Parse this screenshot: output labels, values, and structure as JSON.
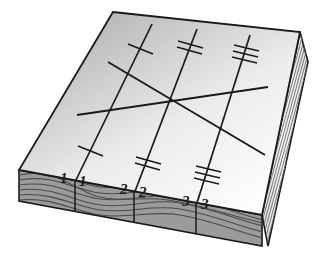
{
  "figure": {
    "type": "isometric-block-diagram",
    "background_color": "#ffffff",
    "outline_color": "#1a1a1a"
  },
  "colors": {
    "top_face_light": "#ffffff",
    "top_face_dark": "#a9a9a9",
    "front_edge_fill": "#9b9b9b",
    "grain_line": "#4a4a4a",
    "side_face_fill": "#f2f2f2",
    "side_hatch": "#6e6e6e",
    "stroke": "#1a1a1a"
  },
  "geometry": {
    "top_face": [
      [
        113,
        12
      ],
      [
        300,
        32
      ],
      [
        262,
        215
      ],
      [
        19,
        170
      ]
    ],
    "front_edge": [
      [
        19,
        170
      ],
      [
        262,
        215
      ],
      [
        262,
        246
      ],
      [
        19,
        201
      ]
    ],
    "right_side": [
      [
        262,
        215
      ],
      [
        300,
        32
      ],
      [
        308,
        62
      ],
      [
        268,
        246
      ]
    ],
    "top_edge_back": [
      [
        113,
        12
      ],
      [
        300,
        32
      ]
    ],
    "front_top_edge": [
      [
        19,
        170
      ],
      [
        262,
        215
      ]
    ]
  },
  "cut_lines": [
    {
      "id": "line-1",
      "label_left": "1",
      "label_right": "1",
      "tick_count": 1,
      "top_point": [
        152,
        26
      ],
      "bottom_point": [
        75,
        184
      ],
      "label_left_pos": [
        63,
        176
      ],
      "label_right_pos": [
        80,
        178
      ],
      "ticks": [
        {
          "cx": 140,
          "cy": 50
        },
        {
          "cx": 90,
          "cy": 152
        }
      ]
    },
    {
      "id": "line-2",
      "label_left": "2",
      "label_right": "2",
      "tick_count": 2,
      "top_point": [
        197,
        31
      ],
      "bottom_point": [
        134,
        196
      ],
      "label_left_pos": [
        123,
        187
      ],
      "label_right_pos": [
        141,
        190
      ],
      "ticks": [
        {
          "cx": 190,
          "cy": 45
        },
        {
          "cx": 148,
          "cy": 161
        }
      ]
    },
    {
      "id": "line-3",
      "label_left": "3",
      "label_right": "3",
      "tick_count": 3,
      "top_point": [
        250,
        37
      ],
      "bottom_point": [
        196,
        208
      ],
      "label_left_pos": [
        185,
        199
      ],
      "label_right_pos": [
        203,
        201
      ],
      "ticks": [
        {
          "cx": 246,
          "cy": 51
        },
        {
          "cx": 208,
          "cy": 172
        }
      ]
    }
  ],
  "diagonals": [
    {
      "id": "diagonal-ascending",
      "from": [
        77,
        115
      ],
      "to": [
        268,
        87
      ]
    },
    {
      "id": "diagonal-descending",
      "from": [
        108,
        62
      ],
      "to": [
        265,
        155
      ]
    },
    {
      "id": "crossing_point",
      "at": [
        175,
        100
      ]
    }
  ],
  "grain_lines_count": 7,
  "side_hatch_count": 9,
  "labels_note": "paired italic numerals flank each cut line at the front edge"
}
